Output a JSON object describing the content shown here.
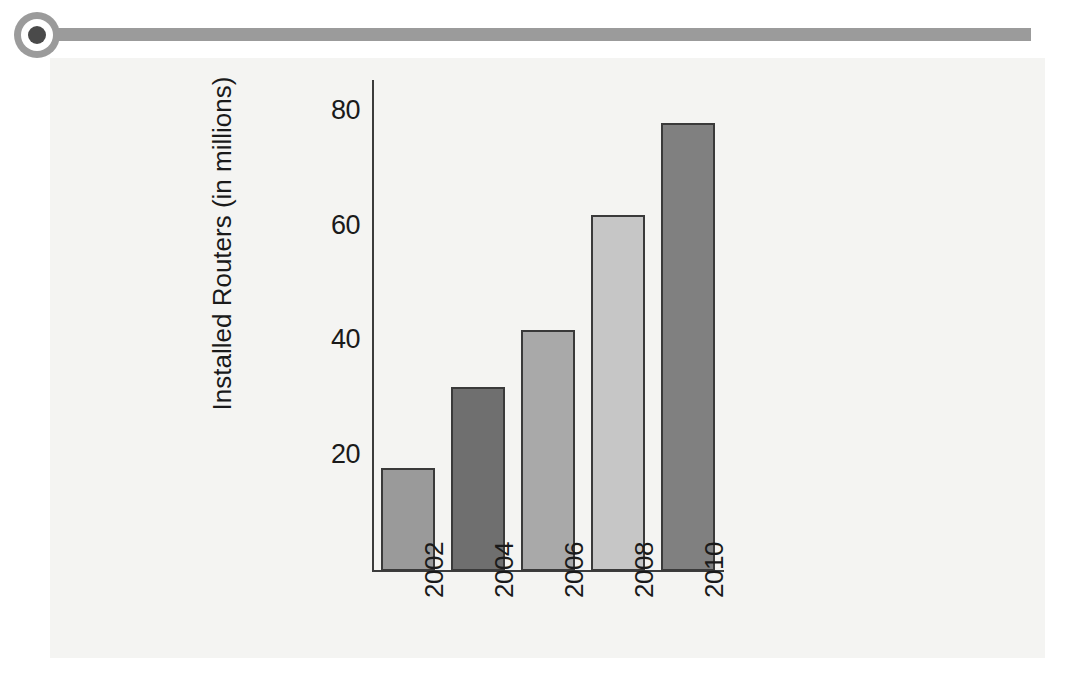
{
  "header": {
    "bullet_icon": "filled-circle-bullet-icon",
    "rule_color": "#9b9b9b"
  },
  "panel": {
    "background_color": "#f4f4f2"
  },
  "chart_data": {
    "type": "bar",
    "title": "",
    "xlabel": "",
    "ylabel": "Installed Routers (in millions)",
    "categories": [
      "2002",
      "2004",
      "2006",
      "2008",
      "2010"
    ],
    "values": [
      18,
      32,
      42,
      62,
      78
    ],
    "bar_colors": [
      "#9a9a9a",
      "#6f6f6f",
      "#a9a9a9",
      "#c6c6c6",
      "#808080"
    ],
    "bar_border_color": "#3a3a3a",
    "ylim": [
      0,
      88
    ],
    "yticks": [
      20,
      40,
      60,
      80
    ],
    "ytick_labels": [
      "20",
      "40",
      "60",
      "80"
    ],
    "grid": false,
    "legend": false,
    "xtick_rotation": 90,
    "axis_color": "#3c3c3c",
    "plot_background": "#f4f4f2"
  }
}
